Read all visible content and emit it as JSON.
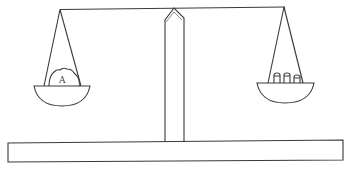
{
  "diagram": {
    "type": "balance-scale",
    "colors": {
      "line": "#3a3a3a",
      "background": "#ffffff",
      "label": "#444444"
    },
    "left_pan": {
      "object_label": "A",
      "object_shape": "irregular-lump"
    },
    "right_pan": {
      "weights_count": 3,
      "weights_shape": "cylindrical-weights"
    },
    "components": [
      "beam",
      "central-pillar",
      "left-pan",
      "right-pan",
      "base-plank"
    ]
  }
}
